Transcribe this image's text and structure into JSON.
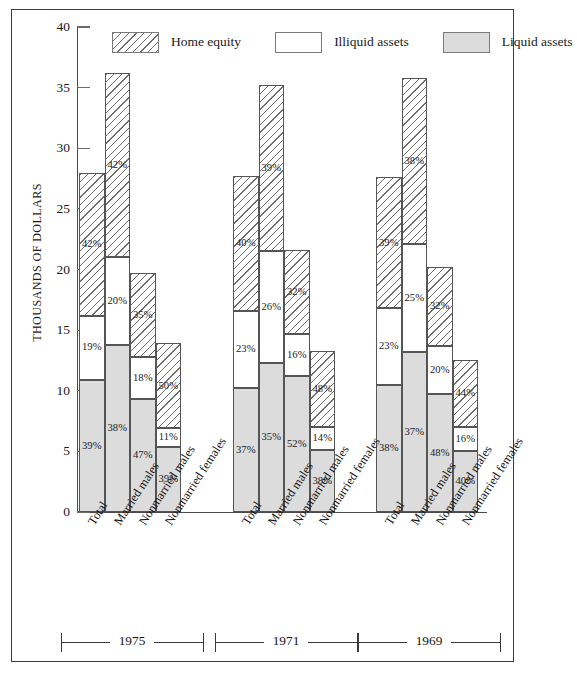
{
  "chart_data": {
    "type": "bar",
    "title": "",
    "subtitle": "",
    "xlabel": "",
    "ylabel": "THOUSANDS OF DOLLARS",
    "ylim": [
      0,
      40
    ],
    "ytick_labels": [
      "0",
      "5",
      "10",
      "15",
      "20",
      "25",
      "30",
      "35",
      "40"
    ],
    "ytick_values": [
      0,
      5,
      10,
      15,
      20,
      25,
      30,
      35,
      40
    ],
    "grid": false,
    "stacked": true,
    "legend_position": "top",
    "legend": [
      {
        "label": "Home equity",
        "fill": "hatch"
      },
      {
        "label": "Illiquid assets",
        "fill": "white"
      },
      {
        "label": "Liquid assets",
        "fill": "gray"
      }
    ],
    "series_order": [
      "Liquid assets",
      "Illiquid assets",
      "Home equity"
    ],
    "categories": [
      "Total",
      "Married males",
      "Nonmarried males",
      "Nonmarried females"
    ],
    "groups": [
      {
        "year": "1975",
        "bars": [
          {
            "category": "Total",
            "total": 28.0,
            "segments": [
              {
                "series": "Liquid assets",
                "value": 10.9,
                "pct": "39%"
              },
              {
                "series": "Illiquid assets",
                "value": 5.3,
                "pct": "19%"
              },
              {
                "series": "Home equity",
                "value": 11.8,
                "pct": "42%"
              }
            ]
          },
          {
            "category": "Married males",
            "total": 36.2,
            "segments": [
              {
                "series": "Liquid assets",
                "value": 13.8,
                "pct": "38%"
              },
              {
                "series": "Illiquid assets",
                "value": 7.2,
                "pct": "20%"
              },
              {
                "series": "Home equity",
                "value": 15.2,
                "pct": "42%"
              }
            ]
          },
          {
            "category": "Nonmarried males",
            "total": 19.7,
            "segments": [
              {
                "series": "Liquid assets",
                "value": 9.3,
                "pct": "47%"
              },
              {
                "series": "Illiquid assets",
                "value": 3.5,
                "pct": "18%"
              },
              {
                "series": "Home equity",
                "value": 6.9,
                "pct": "35%"
              }
            ]
          },
          {
            "category": "Nonmarried females",
            "total": 13.9,
            "segments": [
              {
                "series": "Liquid assets",
                "value": 5.4,
                "pct": "39%"
              },
              {
                "series": "Illiquid assets",
                "value": 1.5,
                "pct": "11%"
              },
              {
                "series": "Home equity",
                "value": 7.0,
                "pct": "50%"
              }
            ]
          }
        ]
      },
      {
        "year": "1971",
        "bars": [
          {
            "category": "Total",
            "total": 27.7,
            "segments": [
              {
                "series": "Liquid assets",
                "value": 10.2,
                "pct": "37%"
              },
              {
                "series": "Illiquid assets",
                "value": 6.4,
                "pct": "23%"
              },
              {
                "series": "Home equity",
                "value": 11.1,
                "pct": "40%"
              }
            ]
          },
          {
            "category": "Married males",
            "total": 35.2,
            "segments": [
              {
                "series": "Liquid assets",
                "value": 12.3,
                "pct": "35%"
              },
              {
                "series": "Illiquid assets",
                "value": 9.2,
                "pct": "26%"
              },
              {
                "series": "Home equity",
                "value": 13.7,
                "pct": "39%"
              }
            ]
          },
          {
            "category": "Nonmarried males",
            "total": 21.6,
            "segments": [
              {
                "series": "Liquid assets",
                "value": 11.2,
                "pct": "52%"
              },
              {
                "series": "Illiquid assets",
                "value": 3.5,
                "pct": "16%"
              },
              {
                "series": "Home equity",
                "value": 6.9,
                "pct": "32%"
              }
            ]
          },
          {
            "category": "Nonmarried females",
            "total": 13.3,
            "segments": [
              {
                "series": "Liquid assets",
                "value": 5.1,
                "pct": "38%"
              },
              {
                "series": "Illiquid assets",
                "value": 1.9,
                "pct": "14%"
              },
              {
                "series": "Home equity",
                "value": 6.3,
                "pct": "48%"
              }
            ]
          }
        ]
      },
      {
        "year": "1969",
        "bars": [
          {
            "category": "Total",
            "total": 27.6,
            "segments": [
              {
                "series": "Liquid assets",
                "value": 10.5,
                "pct": "38%"
              },
              {
                "series": "Illiquid assets",
                "value": 6.3,
                "pct": "23%"
              },
              {
                "series": "Home equity",
                "value": 10.8,
                "pct": "39%"
              }
            ]
          },
          {
            "category": "Married males",
            "total": 35.8,
            "segments": [
              {
                "series": "Liquid assets",
                "value": 13.2,
                "pct": "37%"
              },
              {
                "series": "Illiquid assets",
                "value": 8.9,
                "pct": "25%"
              },
              {
                "series": "Home equity",
                "value": 13.7,
                "pct": "38%"
              }
            ]
          },
          {
            "category": "Nonmarried males",
            "total": 20.2,
            "segments": [
              {
                "series": "Liquid assets",
                "value": 9.7,
                "pct": "48%"
              },
              {
                "series": "Illiquid assets",
                "value": 4.0,
                "pct": "20%"
              },
              {
                "series": "Home equity",
                "value": 6.5,
                "pct": "32%"
              }
            ]
          },
          {
            "category": "Nonmarried females",
            "total": 12.5,
            "segments": [
              {
                "series": "Liquid assets",
                "value": 5.0,
                "pct": "40%"
              },
              {
                "series": "Illiquid assets",
                "value": 2.0,
                "pct": "16%"
              },
              {
                "series": "Home equity",
                "value": 5.5,
                "pct": "44%"
              }
            ]
          }
        ]
      }
    ]
  }
}
